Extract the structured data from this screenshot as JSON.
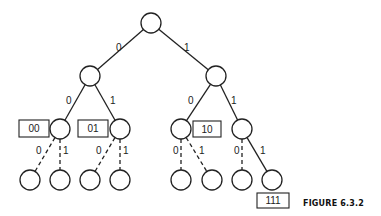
{
  "figure": {
    "caption": "FIGURE 6.3.2"
  },
  "nodes": [
    {
      "id": "root",
      "cx": 151,
      "cy": 23
    },
    {
      "id": "n0",
      "cx": 90,
      "cy": 76
    },
    {
      "id": "n1",
      "cx": 216,
      "cy": 76
    },
    {
      "id": "n00",
      "cx": 60,
      "cy": 129
    },
    {
      "id": "n01",
      "cx": 120,
      "cy": 129
    },
    {
      "id": "n10",
      "cx": 181,
      "cy": 129
    },
    {
      "id": "n11",
      "cx": 242,
      "cy": 129
    },
    {
      "id": "n000",
      "cx": 30,
      "cy": 180
    },
    {
      "id": "n001",
      "cx": 60,
      "cy": 180
    },
    {
      "id": "n010",
      "cx": 90,
      "cy": 180
    },
    {
      "id": "n011",
      "cx": 120,
      "cy": 180
    },
    {
      "id": "n100",
      "cx": 181,
      "cy": 180
    },
    {
      "id": "n101",
      "cx": 212,
      "cy": 180
    },
    {
      "id": "n110",
      "cx": 242,
      "cy": 180
    },
    {
      "id": "n111",
      "cx": 272,
      "cy": 180
    }
  ],
  "edges": [
    {
      "from": "root",
      "to": "n0",
      "label": "0",
      "style": "solid",
      "lx": 116,
      "ly": 47
    },
    {
      "from": "root",
      "to": "n1",
      "label": "1",
      "style": "solid",
      "lx": 184,
      "ly": 47
    },
    {
      "from": "n0",
      "to": "n00",
      "label": "0",
      "style": "solid",
      "lx": 66,
      "ly": 100
    },
    {
      "from": "n0",
      "to": "n01",
      "label": "1",
      "style": "solid",
      "lx": 110,
      "ly": 100
    },
    {
      "from": "n1",
      "to": "n10",
      "label": "0",
      "style": "solid",
      "lx": 188,
      "ly": 100
    },
    {
      "from": "n1",
      "to": "n11",
      "label": "1",
      "style": "solid",
      "lx": 231,
      "ly": 100
    },
    {
      "from": "n00",
      "to": "n000",
      "label": "0",
      "style": "dashed",
      "lx": 36,
      "ly": 150
    },
    {
      "from": "n00",
      "to": "n001",
      "label": "1",
      "style": "dashed",
      "lx": 63,
      "ly": 150
    },
    {
      "from": "n01",
      "to": "n010",
      "label": "0",
      "style": "dashed",
      "lx": 96,
      "ly": 150
    },
    {
      "from": "n01",
      "to": "n011",
      "label": "1",
      "style": "dashed",
      "lx": 123,
      "ly": 150
    },
    {
      "from": "n10",
      "to": "n100",
      "label": "0",
      "style": "dashed",
      "lx": 173,
      "ly": 150
    },
    {
      "from": "n10",
      "to": "n101",
      "label": "1",
      "style": "dashed",
      "lx": 199,
      "ly": 150
    },
    {
      "from": "n11",
      "to": "n110",
      "label": "0",
      "style": "dashed",
      "lx": 234,
      "ly": 150
    },
    {
      "from": "n11",
      "to": "n111",
      "label": "1",
      "style": "solid",
      "lx": 260,
      "ly": 150
    }
  ],
  "codewords": [
    {
      "text": "00",
      "x": 19,
      "y": 120,
      "w": 30,
      "h": 17
    },
    {
      "text": "01",
      "x": 78,
      "y": 120,
      "w": 30,
      "h": 17
    },
    {
      "text": "10",
      "x": 193,
      "y": 121,
      "w": 28,
      "h": 16
    },
    {
      "text": "111",
      "x": 257,
      "y": 193,
      "w": 32,
      "h": 15
    }
  ],
  "node_radius": 10
}
